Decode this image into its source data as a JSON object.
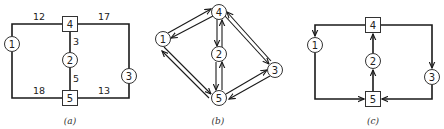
{
  "figure": {
    "panels": [
      {
        "id": "a",
        "caption": "(a)",
        "nodes": [
          {
            "id": "1",
            "label": "1",
            "shape": "circle"
          },
          {
            "id": "2",
            "label": "2",
            "shape": "circle"
          },
          {
            "id": "3",
            "label": "3",
            "shape": "circle"
          },
          {
            "id": "4",
            "label": "4",
            "shape": "square"
          },
          {
            "id": "5",
            "label": "5",
            "shape": "square"
          }
        ],
        "edges": [
          {
            "from": "1",
            "to": "4",
            "weight": "12"
          },
          {
            "from": "4",
            "to": "3",
            "weight": "17"
          },
          {
            "from": "4",
            "to": "2",
            "weight": "3"
          },
          {
            "from": "2",
            "to": "5",
            "weight": "5"
          },
          {
            "from": "1",
            "to": "5",
            "weight": "18"
          },
          {
            "from": "5",
            "to": "3",
            "weight": "13"
          }
        ]
      },
      {
        "id": "b",
        "caption": "(b)",
        "nodes": [
          {
            "id": "1",
            "label": "1",
            "shape": "circle"
          },
          {
            "id": "2",
            "label": "2",
            "shape": "circle"
          },
          {
            "id": "3",
            "label": "3",
            "shape": "circle"
          },
          {
            "id": "4",
            "label": "4",
            "shape": "circle"
          },
          {
            "id": "5",
            "label": "5",
            "shape": "circle"
          }
        ],
        "edges": [
          {
            "from": "1",
            "to": "4",
            "directed": "both"
          },
          {
            "from": "4",
            "to": "2",
            "directed": "both"
          },
          {
            "from": "4",
            "to": "3",
            "directed": "both"
          },
          {
            "from": "1",
            "to": "5",
            "directed": "both"
          },
          {
            "from": "2",
            "to": "5",
            "directed": "both"
          },
          {
            "from": "5",
            "to": "3",
            "directed": "both"
          }
        ]
      },
      {
        "id": "c",
        "caption": "(c)",
        "nodes": [
          {
            "id": "1",
            "label": "1",
            "shape": "circle"
          },
          {
            "id": "2",
            "label": "2",
            "shape": "circle"
          },
          {
            "id": "3",
            "label": "3",
            "shape": "circle"
          },
          {
            "id": "4",
            "label": "4",
            "shape": "square"
          },
          {
            "id": "5",
            "label": "5",
            "shape": "square"
          }
        ],
        "edges": [
          {
            "from": "4",
            "to": "1",
            "directed": true
          },
          {
            "from": "4",
            "to": "3",
            "directed": true
          },
          {
            "from": "1",
            "to": "5",
            "directed": true
          },
          {
            "from": "3",
            "to": "5",
            "directed": true
          },
          {
            "from": "5",
            "to": "2",
            "directed": true
          },
          {
            "from": "2",
            "to": "4",
            "directed": true
          }
        ]
      }
    ]
  },
  "labels": {
    "a": {
      "n1": "1",
      "n2": "2",
      "n3": "3",
      "n4": "4",
      "n5": "5",
      "w14": "12",
      "w43": "17",
      "w42": "3",
      "w25": "5",
      "w15": "18",
      "w53": "13",
      "caption": "(a)"
    },
    "b": {
      "n1": "1",
      "n2": "2",
      "n3": "3",
      "n4": "4",
      "n5": "5",
      "caption": "(b)"
    },
    "c": {
      "n1": "1",
      "n2": "2",
      "n3": "3",
      "n4": "4",
      "n5": "5",
      "caption": "(c)"
    }
  }
}
